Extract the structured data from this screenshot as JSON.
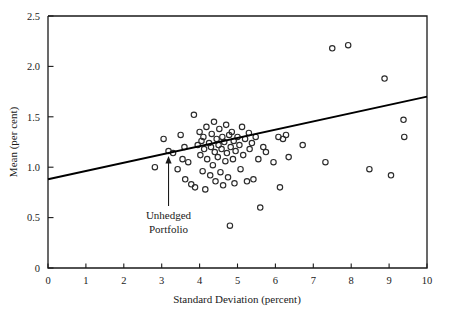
{
  "chart_data": {
    "type": "scatter",
    "title": "",
    "xlabel": "Standard Deviation (percent)",
    "ylabel": "Mean (per cent)",
    "xlim": [
      0,
      10
    ],
    "ylim": [
      0,
      2.5
    ],
    "xticks": [
      0,
      1,
      2,
      3,
      4,
      5,
      6,
      7,
      8,
      9,
      10
    ],
    "xtick_labels": [
      "0",
      "1",
      "2",
      "3",
      "4",
      "5",
      "6",
      "7",
      "8",
      "9",
      "10"
    ],
    "yticks": [
      0,
      0.5,
      1.0,
      1.5,
      2.0,
      2.5
    ],
    "ytick_labels": [
      "0",
      "0.5",
      "1.0",
      "1.5",
      "2.0",
      "2.5"
    ],
    "grid": false,
    "legend": "none",
    "marker": "open-circle",
    "marker_color": "#2b2b2b",
    "points": [
      [
        2.82,
        1.0
      ],
      [
        3.05,
        1.28
      ],
      [
        3.18,
        1.16
      ],
      [
        3.3,
        1.14
      ],
      [
        3.42,
        0.98
      ],
      [
        3.5,
        1.32
      ],
      [
        3.55,
        1.08
      ],
      [
        3.6,
        1.2
      ],
      [
        3.62,
        0.88
      ],
      [
        3.7,
        1.05
      ],
      [
        3.78,
        0.83
      ],
      [
        3.85,
        1.52
      ],
      [
        3.88,
        0.8
      ],
      [
        3.95,
        1.22
      ],
      [
        4.0,
        1.35
      ],
      [
        4.02,
        1.12
      ],
      [
        4.05,
        1.26
      ],
      [
        4.08,
        0.96
      ],
      [
        4.1,
        1.3
      ],
      [
        4.12,
        1.18
      ],
      [
        4.15,
        0.78
      ],
      [
        4.18,
        1.4
      ],
      [
        4.2,
        1.08
      ],
      [
        4.25,
        1.24
      ],
      [
        4.28,
        0.92
      ],
      [
        4.3,
        1.2
      ],
      [
        4.32,
        1.33
      ],
      [
        4.35,
        1.02
      ],
      [
        4.38,
        1.45
      ],
      [
        4.4,
        1.15
      ],
      [
        4.42,
        0.86
      ],
      [
        4.45,
        1.28
      ],
      [
        4.48,
        1.1
      ],
      [
        4.5,
        1.22
      ],
      [
        4.52,
        1.38
      ],
      [
        4.55,
        0.95
      ],
      [
        4.58,
        1.18
      ],
      [
        4.6,
        1.3
      ],
      [
        4.62,
        0.82
      ],
      [
        4.65,
        1.25
      ],
      [
        4.68,
        1.06
      ],
      [
        4.7,
        1.42
      ],
      [
        4.72,
        1.14
      ],
      [
        4.75,
        0.9
      ],
      [
        4.78,
        1.32
      ],
      [
        4.8,
        0.42
      ],
      [
        4.82,
        1.2
      ],
      [
        4.85,
        1.35
      ],
      [
        4.88,
        1.08
      ],
      [
        4.9,
        1.26
      ],
      [
        4.92,
        0.84
      ],
      [
        4.95,
        1.16
      ],
      [
        5.0,
        1.3
      ],
      [
        5.05,
        1.22
      ],
      [
        5.08,
        0.98
      ],
      [
        5.12,
        1.4
      ],
      [
        5.15,
        1.12
      ],
      [
        5.2,
        1.28
      ],
      [
        5.25,
        0.86
      ],
      [
        5.3,
        1.34
      ],
      [
        5.32,
        1.18
      ],
      [
        5.38,
        1.24
      ],
      [
        5.42,
        0.88
      ],
      [
        5.48,
        1.3
      ],
      [
        5.55,
        1.08
      ],
      [
        5.6,
        0.6
      ],
      [
        5.68,
        1.2
      ],
      [
        5.75,
        1.15
      ],
      [
        5.95,
        1.05
      ],
      [
        6.08,
        1.3
      ],
      [
        6.12,
        0.8
      ],
      [
        6.2,
        1.28
      ],
      [
        6.28,
        1.32
      ],
      [
        6.35,
        1.1
      ],
      [
        6.72,
        1.22
      ],
      [
        7.32,
        1.05
      ],
      [
        7.5,
        2.18
      ],
      [
        7.92,
        2.21
      ],
      [
        8.48,
        0.98
      ],
      [
        8.88,
        1.88
      ],
      [
        9.05,
        0.92
      ],
      [
        9.38,
        1.47
      ],
      [
        9.4,
        1.3
      ]
    ],
    "trendline": {
      "x_start": 0,
      "y_start": 0.88,
      "x_end": 10,
      "y_end": 1.7
    },
    "annotation": {
      "line1": "Unhedged",
      "line2": "Portfolio",
      "target_x": 3.18,
      "target_y": 1.16
    }
  }
}
